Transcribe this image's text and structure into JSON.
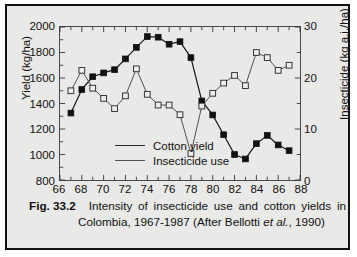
{
  "caption": {
    "figure_number": "Fig. 33.2",
    "line1": "Intensity of insecticide use and cotton yields in",
    "line2_pre": "Colombia, 1967-1987 (After Bellotti ",
    "line2_italic": "et al.",
    "line2_post": ", 1990)"
  },
  "legend": {
    "items": [
      {
        "label": "Cotton yield"
      },
      {
        "label": "Insecticide use"
      }
    ]
  },
  "chart_data": {
    "type": "line",
    "title": "Intensity of insecticide use and cotton yields in Colombia, 1967-1987",
    "xlabel": "",
    "ylabel": "Yield (kg/ha)",
    "y2label": "Insecticide (kg a.i./ha)",
    "xlim": [
      66,
      88
    ],
    "ylim": [
      800,
      2000
    ],
    "y2lim": [
      0,
      30
    ],
    "xticks": [
      66,
      68,
      70,
      72,
      74,
      76,
      78,
      80,
      82,
      84,
      86,
      88
    ],
    "xtick_labels": [
      "66",
      "68",
      "70",
      "72",
      "74",
      "76",
      "78",
      "80",
      "82",
      "84",
      "86",
      "88"
    ],
    "xminor_step": 1,
    "yticks": [
      800,
      1000,
      1200,
      1400,
      1600,
      1800,
      2000
    ],
    "ytick_labels": [
      "800",
      "1000",
      "1200",
      "1400",
      "1600",
      "1800",
      "2000"
    ],
    "y2ticks": [
      0,
      10,
      20,
      30
    ],
    "y2tick_labels": [
      "0",
      "10",
      "20",
      "30"
    ],
    "grid": false,
    "legend_position": "inside-lower-left",
    "x": [
      67,
      68,
      69,
      70,
      71,
      72,
      73,
      74,
      75,
      76,
      77,
      78,
      79,
      80,
      81,
      82,
      83,
      84,
      85,
      86,
      87
    ],
    "series": [
      {
        "name": "Cotton yield",
        "axis": "left",
        "marker": "filled-square",
        "units": "kg/ha",
        "values": [
          1325,
          1510,
          1610,
          1640,
          1665,
          1750,
          1840,
          1925,
          1920,
          1865,
          1885,
          1760,
          1420,
          1310,
          1155,
          1000,
          965,
          1085,
          1150,
          1075,
          1030
        ]
      },
      {
        "name": "Insecticide use",
        "axis": "right",
        "marker": "open-square",
        "units": "kg a.i./ha",
        "values": [
          17.5,
          21.5,
          18.0,
          16.0,
          14.0,
          16.5,
          21.8,
          16.8,
          14.7,
          14.7,
          12.8,
          5.2,
          14.5,
          17.0,
          19.0,
          20.5,
          18.5,
          25.0,
          24.0,
          21.5,
          22.5
        ]
      }
    ]
  }
}
